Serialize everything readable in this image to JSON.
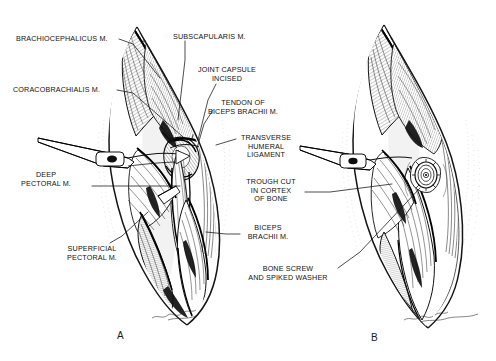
{
  "figure": {
    "background_color": "#ffffff",
    "ink_color": "#111111",
    "width": 496,
    "height": 361
  },
  "panels": [
    {
      "id": "A",
      "label": "A",
      "label_x": 117,
      "label_y": 330,
      "caption": "Craniomedial approach with joint capsule incised, biceps tendon exposed"
    },
    {
      "id": "B",
      "label": "B",
      "label_x": 371,
      "label_y": 332,
      "caption": "Biceps tendon secured in trough with bone screw and spiked washer"
    }
  ],
  "labels": [
    {
      "name": "brachiocephalicus-m",
      "lines": [
        "BRACHIOCEPHALICUS M."
      ],
      "x": 16,
      "y": 35,
      "align": "l",
      "leader": [
        [
          119,
          39
        ],
        [
          133,
          44
        ],
        [
          160,
          78
        ]
      ]
    },
    {
      "name": "coracobrachialis-m",
      "lines": [
        "CORACOBRACHIALIS M."
      ],
      "x": 13,
      "y": 86,
      "align": "l",
      "leader": [
        [
          117,
          90
        ],
        [
          133,
          93
        ],
        [
          190,
          143
        ]
      ]
    },
    {
      "name": "deep-pectoral-m",
      "lines": [
        "DEEP",
        "PECTORAL M."
      ],
      "x": 46,
      "y": 171,
      "align": "c",
      "leader": [
        [
          92,
          186
        ],
        [
          180,
          186
        ]
      ]
    },
    {
      "name": "superficial-pectoral-m",
      "lines": [
        "SUPERFICIAL",
        "PECTORAL M."
      ],
      "x": 92,
      "y": 245,
      "align": "c",
      "leader": [
        [
          110,
          243
        ],
        [
          122,
          236
        ],
        [
          148,
          212
        ]
      ]
    },
    {
      "name": "subscapularis-m",
      "lines": [
        "SUBSCAPULARIS M."
      ],
      "x": 173,
      "y": 33,
      "align": "l",
      "leader": [
        [
          185,
          41
        ],
        [
          185,
          60
        ],
        [
          178,
          120
        ]
      ]
    },
    {
      "name": "joint-capsule-incised",
      "lines": [
        "JOINT CAPSULE",
        "INCISED"
      ],
      "x": 227,
      "y": 66,
      "align": "c",
      "leader": [
        [
          216,
          84
        ],
        [
          208,
          100
        ],
        [
          198,
          140
        ]
      ]
    },
    {
      "name": "tendon-of-biceps-brachii-m",
      "lines": [
        "TENDON OF",
        "BICEPS BRACHII M."
      ],
      "x": 243,
      "y": 99,
      "align": "c",
      "leader": [
        [
          213,
          110
        ],
        [
          204,
          124
        ],
        [
          197,
          148
        ]
      ]
    },
    {
      "name": "transverse-humeral-ligament",
      "lines": [
        "TRANSVERSE",
        "HUMERAL",
        "LIGAMENT"
      ],
      "x": 266,
      "y": 134,
      "align": "c",
      "leader": [
        [
          236,
          139
        ],
        [
          216,
          145
        ]
      ]
    },
    {
      "name": "trough-cut-in-cortex-of-bone",
      "lines": [
        "TROUGH CUT",
        "IN CORTEX",
        "OF BONE"
      ],
      "x": 271,
      "y": 178,
      "align": "c",
      "leader": [
        [
          305,
          192
        ],
        [
          330,
          192
        ],
        [
          392,
          184
        ]
      ]
    },
    {
      "name": "biceps-brachii-m",
      "lines": [
        "BICEPS",
        "BRACHII M."
      ],
      "x": 268,
      "y": 224,
      "align": "c",
      "leader": [
        [
          240,
          234
        ],
        [
          226,
          234
        ],
        [
          206,
          232
        ]
      ]
    },
    {
      "name": "bone-screw-and-spiked-washer",
      "lines": [
        "BONE SCREW",
        "AND SPIKED WASHER"
      ],
      "x": 288,
      "y": 265,
      "align": "c",
      "leader": [
        [
          338,
          268
        ],
        [
          360,
          252
        ],
        [
          420,
          188
        ]
      ]
    }
  ],
  "artist_signature": {
    "name": "artist-signature",
    "visible": true,
    "description": "handwritten signature mark near lower edge of each panel"
  }
}
